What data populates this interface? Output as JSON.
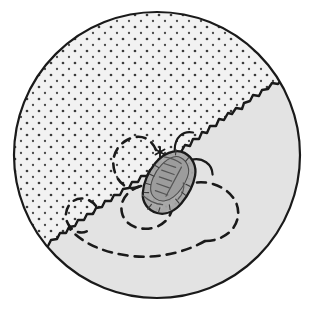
{
  "figure": {
    "title": "Circular habitat field diagram with tick specimen",
    "background_color": "#ffffff"
  },
  "canvas": {
    "width": 309,
    "height": 315
  },
  "circle": {
    "label": "field-boundary-circle",
    "center_x": 157,
    "center_y": 155,
    "radius": 143,
    "stroke_color": "#1a1a1a",
    "stroke_width": 2.2,
    "fill_color": "#ffffff"
  },
  "regions": [
    {
      "id": "stippled-region",
      "label": "Stippled region",
      "fill_color": "#f2f2f2",
      "pattern": "dot-stipple",
      "dot_color": "#3c3c3c",
      "dot_radius": 1.35,
      "dot_spacing": 12,
      "position": "upper-left"
    },
    {
      "id": "shaded-region",
      "label": "Shaded region",
      "fill_color": "#e3e3e3",
      "pattern": "solid",
      "position": "lower-right"
    }
  ],
  "boundary": {
    "label": "jagged-region-boundary",
    "stroke_color": "#1a1a1a",
    "stroke_width": 2.4,
    "style": "irregular-jagged",
    "orientation": "diagonal from upper-right to lower-left",
    "path": "M 283 78 L 278 84 L 272 83 L 268 89 L 262 90 L 259 96 L 253 95 L 250 101 L 244 103 L 242 109 L 236 108 L 232 114 L 228 113 L 224 120 L 219 119 L 216 126 L 210 126 L 207 133 L 202 132 L 199 139 L 193 139 L 190 146 L 185 145 L 181 152 L 176 152 L 173 158 L 168 158 L 164 164 L 159 164 L 155 170 L 150 170 L 147 176 L 141 176 L 138 182 L 132 182 L 129 188 L 123 189 L 120 195 L 114 195 L 111 201 L 105 201 L 102 207 L 96 208 L 93 214 L 87 214 L 84 220 L 78 220 L 75 226 L 69 227 L 66 233 L 60 233 L 57 239 L 51 240 L 48 246 L 42 247 L 39 253 L 34 254"
  },
  "specimen": {
    "label": "tick-specimen",
    "common_name": "tick",
    "body": {
      "center_x": 169,
      "center_y": 182,
      "width": 42,
      "height": 66,
      "rotation_deg": 28,
      "fill_color": "#a8a8a8",
      "stroke_color": "#1a1a1a",
      "stroke_width": 2.2
    },
    "scutum": {
      "fill_color": "#9a9a9a",
      "stroke_color": "#4a4a4a"
    },
    "markings_color": "#555555",
    "appendages": {
      "count": 2,
      "stroke_color": "#1a1a1a",
      "stroke_width": 2.2
    }
  },
  "marker": {
    "label": "asterisk-marker",
    "glyph": "asterisk",
    "x": 160,
    "y": 152,
    "color": "#1a1a1a",
    "size": 9
  },
  "trails": [
    {
      "id": "trail-upper-loop",
      "label": "Upper dashed loop",
      "stroke_color": "#1a1a1a",
      "stroke_width": 2.6,
      "dash_pattern": "9 7",
      "path": "M 156 150 C 150 136, 138 134, 127 140 C 114 147, 110 162, 116 175 C 121 187, 132 191, 140 186"
    },
    {
      "id": "trail-small-left-loop",
      "label": "Small left dashed loop",
      "stroke_color": "#1a1a1a",
      "stroke_width": 2.6,
      "dash_pattern": "9 7",
      "path": "M 96 206 C 90 198, 79 196, 72 202 C 64 209, 64 221, 71 228 C 76 233, 84 234, 89 230"
    },
    {
      "id": "trail-centre-loop",
      "label": "Centre dashed loop",
      "stroke_color": "#1a1a1a",
      "stroke_width": 2.6,
      "dash_pattern": "9 7",
      "path": "M 141 186 C 128 190, 119 200, 122 213 C 125 226, 141 232, 156 227 C 169 222, 175 210, 171 199"
    },
    {
      "id": "trail-right-loop",
      "label": "Right dashed loop",
      "stroke_color": "#1a1a1a",
      "stroke_width": 2.6,
      "dash_pattern": "9 7",
      "path": "M 171 199 C 178 186, 193 180, 209 183 C 228 187, 240 201, 238 216 C 236 231, 222 241, 205 241"
    },
    {
      "id": "trail-bottom-arc",
      "label": "Bottom dashed arc",
      "stroke_color": "#1a1a1a",
      "stroke_width": 2.6,
      "dash_pattern": "9 7",
      "path": "M 205 241 C 186 252, 158 259, 131 256 C 104 253, 82 243, 70 229"
    }
  ]
}
